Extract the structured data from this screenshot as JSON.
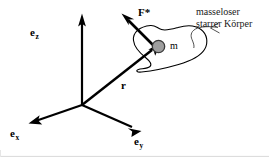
{
  "figure": {
    "background_color": "#ffffff",
    "stroke_color": "#000000",
    "mass_fill_color": "#9e9e9e",
    "mass_stroke_color": "#3a3a3a",
    "border_color": "#d9d9d9"
  },
  "axes": {
    "z_label": "e",
    "z_subscript": "z",
    "x_label": "e",
    "x_subscript": "x",
    "y_label": "e",
    "y_subscript": "y"
  },
  "vectors": {
    "position_label": "r",
    "force_label": "F*"
  },
  "body": {
    "mass_label": "m",
    "caption_line1": "masseloser",
    "caption_line2": "starrer Körper"
  }
}
